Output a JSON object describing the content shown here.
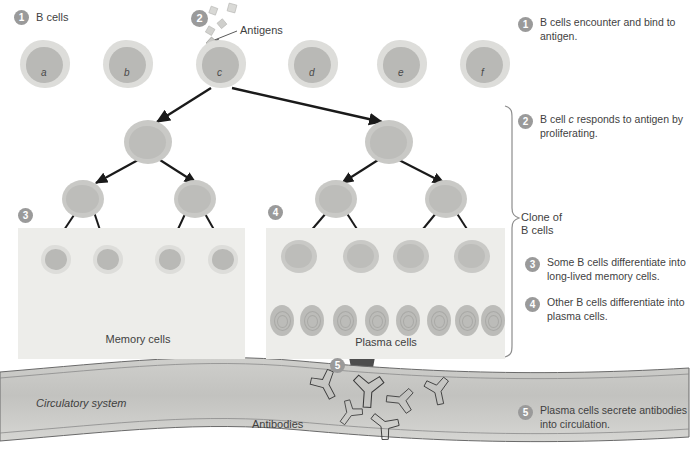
{
  "figure": {
    "labels": {
      "b_cells": "B cells",
      "antigens": "Antigens",
      "memory_cells": "Memory cells",
      "plasma_cells": "Plasma cells",
      "antibodies": "Antibodies",
      "circulatory_system": "Circulatory system",
      "clone_of_b_cells_line1": "Clone of",
      "clone_of_b_cells_line2": "B cells"
    },
    "b_cell_row": [
      {
        "id": "a",
        "letter": "a",
        "x": 20,
        "y": 40
      },
      {
        "id": "b",
        "letter": "b",
        "x": 103,
        "y": 40
      },
      {
        "id": "c",
        "letter": "c",
        "x": 196,
        "y": 40
      },
      {
        "id": "d",
        "letter": "d",
        "x": 288,
        "y": 40
      },
      {
        "id": "e",
        "letter": "e",
        "x": 377,
        "y": 40
      },
      {
        "id": "f",
        "letter": "f",
        "x": 460,
        "y": 40
      }
    ],
    "selected_cell": "c",
    "steps": [
      {
        "number": "1",
        "text": "B cells encounter and bind to antigen."
      },
      {
        "number": "2",
        "text": "B cell c responds to antigen by proliferating."
      },
      {
        "number": "3",
        "text": "Some B cells differentiate into long-lived memory cells."
      },
      {
        "number": "4",
        "text": "Other B cells differentiate into  plasma cells."
      },
      {
        "number": "5",
        "text": "Plasma cells secrete antibodies into circulation."
      }
    ],
    "step_marker_inline": [
      {
        "number": "1",
        "x": 14,
        "y": 10
      },
      {
        "number": "2",
        "x": 191,
        "y": 10
      },
      {
        "number": "3",
        "x": 18,
        "y": 208
      },
      {
        "number": "4",
        "x": 268,
        "y": 205
      },
      {
        "number": "5",
        "x": 330,
        "y": 358
      }
    ],
    "counts": {
      "founder_b_cells": 6,
      "tier2_cells": 2,
      "tier3_cells": 4,
      "memory_cells": 4,
      "plasma_cells": 8,
      "antigen_particles": 6,
      "antibodies": 6
    },
    "colors": {
      "badge": "#9a9a9a",
      "cell_cytoplasm": "#ddddda",
      "cell_nucleus": "#b9b9b6",
      "panel_background": "#ededea",
      "vessel_fill": "#c4c4c1",
      "arrow": "#1a1a1a",
      "text": "#3f3f3f"
    }
  }
}
